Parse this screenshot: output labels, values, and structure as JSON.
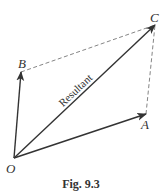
{
  "figure": {
    "caption": "Fig. 9.3",
    "colors": {
      "ink": "#333333",
      "dashed": "#777777",
      "background": "#ffffff"
    },
    "points": {
      "O": {
        "label": "O",
        "x": 14,
        "y": 158
      },
      "A": {
        "label": "A",
        "x": 146,
        "y": 114
      },
      "B": {
        "label": "B",
        "x": 21,
        "y": 72
      },
      "C": {
        "label": "C",
        "x": 155,
        "y": 25
      }
    },
    "vectors": [
      {
        "from": "O",
        "to": "A",
        "style": "solid-arrow"
      },
      {
        "from": "O",
        "to": "B",
        "style": "solid-arrow"
      },
      {
        "from": "O",
        "to": "C",
        "style": "solid-arrow",
        "label": "Resultant"
      }
    ],
    "dashed_lines": [
      {
        "from": "B",
        "to": "C"
      },
      {
        "from": "A",
        "to": "C"
      }
    ],
    "resultant_label": "Resultant"
  }
}
